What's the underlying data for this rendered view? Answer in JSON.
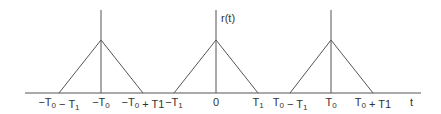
{
  "diagram": {
    "signal_label": "r(t)",
    "axis_label": "t",
    "stroke_color": "#555555",
    "axis": {
      "y": 93,
      "x_start": 25,
      "x_end": 421
    },
    "pulses": [
      {
        "name": "pulse-minus-T0",
        "center_x": 101,
        "left_x": 59,
        "right_x": 143,
        "peak_y": 40
      },
      {
        "name": "pulse-zero",
        "center_x": 216,
        "left_x": 174,
        "right_x": 258,
        "peak_y": 40
      },
      {
        "name": "pulse-plus-T0",
        "center_x": 331,
        "left_x": 290,
        "right_x": 373,
        "peak_y": 40
      }
    ],
    "vertical_top_y": 10,
    "tick_labels": [
      {
        "id": "neg-t0-minus-t1",
        "x": 59,
        "main": "−T",
        "sub": "0",
        "rest": " − T",
        "sub2": "1",
        "tail": ""
      },
      {
        "id": "neg-t0",
        "x": 101,
        "main": "−T",
        "sub": "0",
        "rest": "",
        "sub2": "",
        "tail": ""
      },
      {
        "id": "neg-t0-plus-t1",
        "x": 143,
        "main": "−T",
        "sub": "0",
        "rest": " + T1",
        "sub2": "",
        "tail": ""
      },
      {
        "id": "neg-t1",
        "x": 174,
        "main": "−T",
        "sub": "1",
        "rest": "",
        "sub2": "",
        "tail": ""
      },
      {
        "id": "zero",
        "x": 216,
        "main": "0",
        "sub": "",
        "rest": "",
        "sub2": "",
        "tail": ""
      },
      {
        "id": "t1",
        "x": 258,
        "main": "T",
        "sub": "1",
        "rest": "",
        "sub2": "",
        "tail": ""
      },
      {
        "id": "t0-minus-t1",
        "x": 290,
        "main": "T",
        "sub": "0",
        "rest": " − T",
        "sub2": "1",
        "tail": ""
      },
      {
        "id": "t0",
        "x": 331,
        "main": "T",
        "sub": "0",
        "rest": "",
        "sub2": "",
        "tail": ""
      },
      {
        "id": "t0-plus-t1",
        "x": 373,
        "main": "T",
        "sub": "0",
        "rest": " + T1",
        "sub2": "",
        "tail": ""
      }
    ]
  }
}
